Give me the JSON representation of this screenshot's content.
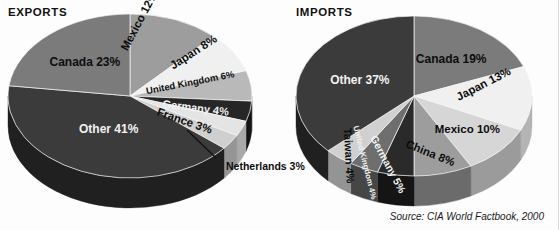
{
  "source_note": "Source: CIA World Factbook, 2000",
  "colors": {
    "background": "#fdfdfd",
    "text": "#0d0d0d",
    "light_text": "#f2f2f2",
    "leader_line": "#111111"
  },
  "charts": [
    {
      "id": "exports",
      "title": "EXPORTS",
      "type": "pie",
      "center": {
        "x": 128,
        "y": 84
      },
      "radius": {
        "rx": 122,
        "ry": 82
      },
      "depth": 30,
      "start_angle_deg": -90,
      "categories": [
        "Mexico",
        "Japan",
        "United Kingdom",
        "Germany",
        "France",
        "Netherlands",
        "Other",
        "Canada"
      ],
      "values": [
        12,
        8,
        6,
        4,
        3,
        3,
        41,
        23
      ],
      "labels": [
        {
          "name": "Mexico",
          "text": "Mexico 12%",
          "value": 12,
          "color": "#9d9d9d",
          "side_color": "#6b6b6b",
          "label_color": "dark",
          "rotate": -62,
          "radial": 0.6,
          "font": 11.5
        },
        {
          "name": "Japan",
          "text": "Japan 8%",
          "value": 8,
          "color": "#f0f0f0",
          "side_color": "#b4b4b4",
          "label_color": "dark",
          "rotate": -33,
          "radial": 0.66,
          "font": 11.5
        },
        {
          "name": "United Kingdom",
          "text": "United Kingdom 6%",
          "value": 6,
          "color": "#b9b9b9",
          "side_color": "#7e7e7e",
          "label_color": "dark",
          "rotate": -11,
          "radial": 0.5,
          "font": 9.5
        },
        {
          "name": "Germany",
          "text": "Germany 4%",
          "value": 4,
          "color": "#262626",
          "side_color": "#141414",
          "label_color": "light",
          "rotate": 7,
          "radial": 0.55,
          "font": 11
        },
        {
          "name": "France",
          "text": "France 3%",
          "value": 3,
          "color": "#e4e4e4",
          "side_color": "#a9a9a9",
          "label_color": "dark",
          "rotate": 19,
          "radial": 0.5,
          "font": 11.5
        },
        {
          "name": "Netherlands",
          "text": "Netherlands 3%",
          "value": 3,
          "color": "#cfcfcf",
          "side_color": "#959595",
          "label_color": "callout",
          "rotate": 0,
          "radial": 0.6,
          "font": 10.5
        },
        {
          "name": "Other",
          "text": "Other 41%",
          "value": 41,
          "color": "#3b3b3b",
          "side_color": "#202020",
          "label_color": "light",
          "rotate": 0,
          "radial": 0.44,
          "font": 12
        },
        {
          "name": "Canada",
          "text": "Canada 23%",
          "value": 23,
          "color": "#7b7b7b",
          "side_color": "#4e4e4e",
          "label_color": "dark",
          "rotate": 0,
          "radial": 0.56,
          "font": 12
        }
      ],
      "callout": {
        "label": "Netherlands 3%",
        "text_left": 224,
        "text_top": 148,
        "line": {
          "x1": 185,
          "y1": 118,
          "x2": 214,
          "y2": 146
        }
      }
    },
    {
      "id": "imports",
      "title": "IMPORTS",
      "type": "pie",
      "center": {
        "x": 124,
        "y": 84
      },
      "radius": {
        "rx": 118,
        "ry": 80
      },
      "depth": 30,
      "start_angle_deg": -90,
      "categories": [
        "Canada",
        "Japan",
        "Mexico",
        "China",
        "Germany",
        "United Kingdom",
        "Taiwan",
        "Other"
      ],
      "values": [
        19,
        13,
        10,
        8,
        5,
        4,
        4,
        37
      ],
      "labels": [
        {
          "name": "Japan",
          "text": "Japan 13%",
          "value": 13,
          "color": "#f0f0f0",
          "side_color": "#b4b4b4",
          "label_color": "dark",
          "rotate": -27,
          "radial": 0.62,
          "font": 11.5
        },
        {
          "name": "Mexico",
          "text": "Mexico 10%",
          "value": 10,
          "color": "#d6d6d6",
          "side_color": "#9b9b9b",
          "label_color": "dark",
          "rotate": 0,
          "radial": 0.62,
          "font": 11.5
        },
        {
          "name": "China",
          "text": "China 8%",
          "value": 8,
          "color": "#9d9d9d",
          "side_color": "#6b6b6b",
          "label_color": "dark",
          "rotate": 22,
          "radial": 0.62,
          "font": 11.5
        },
        {
          "name": "Germany",
          "text": "Germany 5%",
          "value": 5,
          "color": "#2a2a2a",
          "side_color": "#151515",
          "label_color": "light",
          "rotate": 62,
          "radial": 0.5,
          "font": 10.5
        },
        {
          "name": "United Kingdom",
          "text": "United Kingdom 4%",
          "value": 4,
          "color": "#6e6e6e",
          "side_color": "#464646",
          "label_color": "light",
          "rotate": 76,
          "radial": 0.42,
          "font": 8
        },
        {
          "name": "Taiwan",
          "text": "Taiwan 4%",
          "value": 4,
          "color": "#d0d0d0",
          "side_color": "#949494",
          "label_color": "dark",
          "rotate": 87,
          "radial": 0.52,
          "font": 11
        },
        {
          "name": "Other",
          "text": "Other 37%",
          "value": 37,
          "color": "#3b3b3b",
          "side_color": "#202020",
          "label_color": "light",
          "rotate": 0,
          "radial": 0.5,
          "font": 12
        },
        {
          "name": "Canada",
          "text": "Canada 19%",
          "value": 19,
          "color": "#7b7b7b",
          "side_color": "#4e4e4e",
          "label_color": "dark",
          "rotate": 0,
          "radial": 0.56,
          "font": 12
        }
      ]
    }
  ],
  "chart_data": [
    {
      "type": "pie",
      "title": "EXPORTS",
      "subtitle": "",
      "xlabel": "",
      "ylabel": "",
      "unit": "percent",
      "legend": "none (labels on slices)",
      "categories": [
        "Canada",
        "Mexico",
        "Japan",
        "United Kingdom",
        "Germany",
        "France",
        "Netherlands",
        "Other"
      ],
      "values": [
        23,
        12,
        8,
        6,
        4,
        3,
        3,
        41
      ],
      "data_labels": [
        "Canada 23%",
        "Mexico 12%",
        "Japan 8%",
        "United Kingdom 6%",
        "Germany 4%",
        "France 3%",
        "Netherlands 3%",
        "Other 41%"
      ],
      "annotations": [
        "Netherlands 3% has a leader line to its slice"
      ],
      "source": "Source: CIA World Factbook, 2000"
    },
    {
      "type": "pie",
      "title": "IMPORTS",
      "subtitle": "",
      "xlabel": "",
      "ylabel": "",
      "unit": "percent",
      "legend": "none (labels on slices)",
      "categories": [
        "Canada",
        "Japan",
        "Mexico",
        "China",
        "Germany",
        "United Kingdom",
        "Taiwan",
        "Other"
      ],
      "values": [
        19,
        13,
        10,
        8,
        5,
        4,
        4,
        37
      ],
      "data_labels": [
        "Canada 19%",
        "Japan 13%",
        "Mexico 10%",
        "China 8%",
        "Germany 5%",
        "United Kingdom 4%",
        "Taiwan 4%",
        "Other 37%"
      ],
      "annotations": [],
      "source": "Source: CIA World Factbook, 2000"
    }
  ]
}
